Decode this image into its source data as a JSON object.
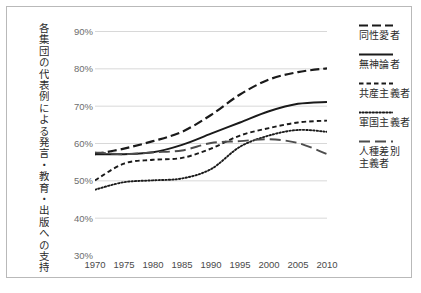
{
  "chart_data": {
    "type": "line",
    "title": "",
    "xlabel": "",
    "ylabel": "各集団の代表例による発言・教育・出版への支持",
    "x": [
      1970,
      1975,
      1980,
      1985,
      1990,
      1995,
      2000,
      2005,
      2010
    ],
    "xlim": [
      1970,
      2010
    ],
    "ylim": [
      30,
      90
    ],
    "yticks": [
      "30%",
      "40%",
      "50%",
      "60%",
      "70%",
      "80%",
      "90%"
    ],
    "ytick_values": [
      30,
      40,
      50,
      60,
      70,
      80,
      90
    ],
    "xticks": [
      "1970",
      "1975",
      "1980",
      "1985",
      "1990",
      "1995",
      "2000",
      "2005",
      "2010"
    ],
    "ytick_suffix": "%",
    "grid": "horizontal",
    "legend_position": "right",
    "series": [
      {
        "name": "同性愛者",
        "style": "dashed",
        "color": "#1a1a1a",
        "values": [
          57.0,
          58.5,
          60.5,
          63.0,
          67.5,
          73.0,
          77.0,
          79.0,
          80.0
        ]
      },
      {
        "name": "無神論者",
        "style": "solid",
        "color": "#1a1a1a",
        "values": [
          57.0,
          57.0,
          57.5,
          59.5,
          62.5,
          65.5,
          68.5,
          70.5,
          71.0
        ]
      },
      {
        "name": "共産主義者",
        "style": "short-dash",
        "color": "#1a1a1a",
        "values": [
          50.0,
          54.5,
          55.5,
          56.0,
          58.5,
          62.0,
          64.0,
          65.5,
          66.0
        ]
      },
      {
        "name": "軍国主義者",
        "style": "dotted",
        "color": "#1a1a1a",
        "values": [
          47.5,
          49.5,
          50.0,
          50.5,
          53.0,
          59.0,
          62.0,
          63.5,
          63.0
        ]
      },
      {
        "name": "人種差別\n主義者",
        "style": "long-dash",
        "color": "#4d4d4d",
        "values": [
          57.5,
          57.0,
          57.5,
          58.0,
          60.0,
          60.5,
          61.0,
          60.0,
          57.0
        ]
      }
    ]
  }
}
